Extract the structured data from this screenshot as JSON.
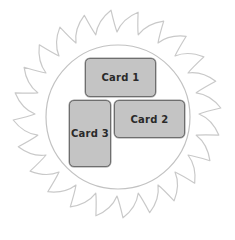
{
  "diagram": {
    "colors": {
      "saw_stroke": "#c9c9c9",
      "circle_stroke": "#c2c2c2",
      "card_fill": "#c4c4c4",
      "card_border": "#6e6e6e",
      "card_text": "#2a2a2a"
    },
    "sawblade": {
      "cx": 117,
      "cy": 114,
      "outer_r": 104,
      "inner_r": 82,
      "teeth": 24
    },
    "circle": {
      "cx": 118,
      "cy": 117,
      "r": 72
    },
    "cards": [
      {
        "label": "Card 1",
        "x": 85,
        "y": 58,
        "w": 71,
        "h": 39
      },
      {
        "label": "Card 2",
        "x": 114,
        "y": 100,
        "w": 71,
        "h": 38
      },
      {
        "label": "Card 3",
        "x": 69,
        "y": 100,
        "w": 42,
        "h": 67
      }
    ]
  }
}
